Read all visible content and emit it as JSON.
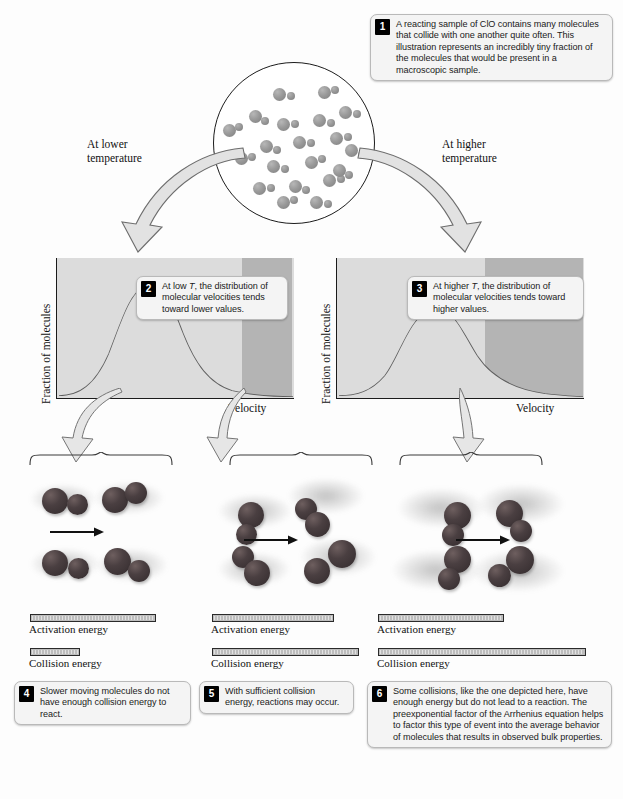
{
  "figure": {
    "accent_badge_bg": "#000000",
    "callout_bg": "#f4f4f4",
    "chart_plot_bg": "#dcdcdc",
    "molecule_color": "#9a9a9a",
    "ball_color": "#4a3f41"
  },
  "callouts": [
    {
      "number": "1",
      "text": "A reacting sample of ClO contains many molecules that collide with one another quite often. This illustration represents an incredibly tiny fraction of the molecules that would be present in a macroscopic sample."
    },
    {
      "number": "2",
      "text_before": "At low ",
      "italic": "T",
      "text_after": ", the distribution of molecular velocities tends toward lower values."
    },
    {
      "number": "3",
      "text_before": "At higher ",
      "italic": "T",
      "text_after": ", the distribution of molecular velocities tends toward higher values."
    },
    {
      "number": "4",
      "text": "Slower moving molecules do not have enough collision energy to react."
    },
    {
      "number": "5",
      "text": "With sufficient collision energy, reactions may occur."
    },
    {
      "number": "6",
      "text": "Some collisions, like the one depicted here, have enough energy but do not lead to a reaction. The preexponential factor of the Arrhenius equation helps to factor this type of event into the average behavior of molecules that results in observed bulk properties."
    }
  ],
  "arrow_labels": {
    "left": "At lower\ntemperature",
    "left_line1": "At lower",
    "left_line2": "temperature",
    "right_line1": "At higher",
    "right_line2": "temperature"
  },
  "charts": [
    {
      "id": "low-temperature-distribution",
      "ylabel": "Fraction of molecules",
      "xlabel": "Velocity"
    },
    {
      "id": "high-temperature-distribution",
      "ylabel": "Fraction of molecules",
      "xlabel": "Velocity"
    }
  ],
  "chart_data": [
    {
      "type": "line",
      "title": "Maxwell-Boltzmann distribution at low T",
      "xlabel": "Velocity",
      "ylabel": "Fraction of molecules",
      "x": [
        0,
        0.05,
        0.1,
        0.15,
        0.2,
        0.25,
        0.3,
        0.35,
        0.4,
        0.45,
        0.5,
        0.55,
        0.6,
        0.65,
        0.7,
        0.75,
        0.8,
        0.85,
        0.9,
        0.95,
        1.0
      ],
      "values": [
        0.0,
        0.03,
        0.12,
        0.33,
        0.62,
        0.87,
        0.98,
        1.0,
        0.93,
        0.8,
        0.64,
        0.49,
        0.36,
        0.26,
        0.19,
        0.14,
        0.1,
        0.07,
        0.05,
        0.04,
        0.03
      ],
      "peak_x": 0.35,
      "peak_y": 1.0,
      "shaded_tail_from": 0.78,
      "shaded_tail_color": "#b0b0b0",
      "grid": false,
      "legend": "none",
      "xlim": [
        0,
        1
      ],
      "ylim": [
        0,
        1.1
      ]
    },
    {
      "type": "line",
      "title": "Maxwell-Boltzmann distribution at higher T",
      "xlabel": "Velocity",
      "ylabel": "Fraction of molecules",
      "x": [
        0,
        0.05,
        0.1,
        0.15,
        0.2,
        0.25,
        0.3,
        0.35,
        0.4,
        0.45,
        0.5,
        0.55,
        0.6,
        0.65,
        0.7,
        0.75,
        0.8,
        0.85,
        0.9,
        0.95,
        1.0
      ],
      "values": [
        0.0,
        0.02,
        0.07,
        0.17,
        0.32,
        0.5,
        0.68,
        0.82,
        0.9,
        0.86,
        0.76,
        0.64,
        0.52,
        0.42,
        0.33,
        0.26,
        0.2,
        0.16,
        0.12,
        0.09,
        0.07
      ],
      "peak_x": 0.4,
      "peak_y": 0.9,
      "shaded_tail_from": 0.62,
      "shaded_tail_color": "#b0b0b0",
      "grid": false,
      "legend": "none",
      "xlim": [
        0,
        1
      ],
      "ylim": [
        0,
        1.1
      ]
    }
  ],
  "energy_panels": [
    {
      "id": "panel-slow-collision",
      "activation_label": "Activation energy",
      "collision_label": "Collision energy",
      "activation_width_px": 126,
      "collision_width_px": 50
    },
    {
      "id": "panel-successful-collision",
      "activation_label": "Activation energy",
      "collision_label": "Collision energy",
      "activation_width_px": 122,
      "collision_width_px": 147
    },
    {
      "id": "panel-energetic-no-reaction",
      "activation_label": "Activation energy",
      "collision_label": "Collision energy",
      "activation_width_px": 126,
      "collision_width_px": 190
    }
  ]
}
